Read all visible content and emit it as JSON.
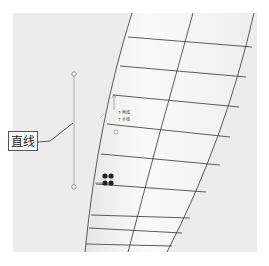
{
  "viewport": {
    "background": "#ececec",
    "surface_fill": "#f4f4f4",
    "grid_color": "#333333"
  },
  "callout": {
    "label": "直线"
  },
  "annotations": {
    "line1": "7 角线",
    "line2": "7 水线"
  },
  "icons": {
    "endpoint_top": "circle-handle",
    "endpoint_bottom": "circle-handle",
    "move_handle": "four-dot-handle"
  }
}
